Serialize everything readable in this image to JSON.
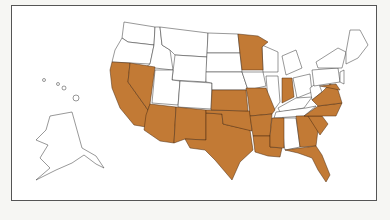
{
  "map": {
    "type": "us-states-highlight",
    "highlight_color": "#c27a35",
    "base_color": "#ffffff",
    "border_color": "#333333",
    "frame_color": "#555555",
    "highlighted_states": [
      "CA",
      "NV",
      "AZ",
      "NM",
      "TX",
      "OK",
      "KS",
      "MO",
      "AR",
      "LA",
      "MS",
      "MN",
      "IN",
      "GA",
      "FL",
      "SC",
      "NC",
      "VA",
      "MD"
    ],
    "unhighlighted_states": [
      "WA",
      "OR",
      "ID",
      "MT",
      "WY",
      "UT",
      "CO",
      "ND",
      "SD",
      "NE",
      "IA",
      "WI",
      "IL",
      "MI",
      "OH",
      "KY",
      "TN",
      "AL",
      "WV",
      "PA",
      "NY",
      "NJ",
      "DE",
      "CT",
      "RI",
      "MA",
      "VT",
      "NH",
      "ME",
      "AK",
      "HI"
    ]
  }
}
